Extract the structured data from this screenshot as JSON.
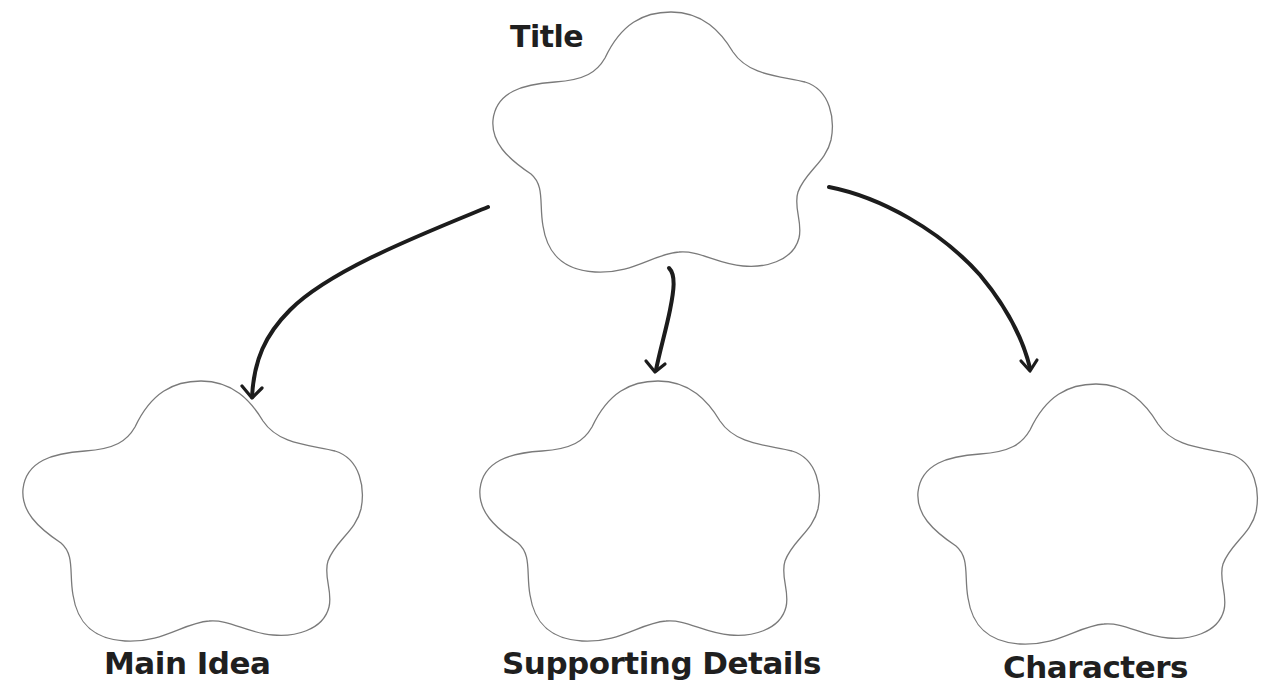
{
  "diagram": {
    "type": "graphic-organizer",
    "colors": {
      "background": "#ffffff",
      "cloud_outline": "#7a7a7a",
      "arrow": "#1c1c1c",
      "label_text": "#1f1f1f"
    },
    "nodes": [
      {
        "id": "title",
        "label": "Title",
        "shape": "cloud",
        "content": ""
      },
      {
        "id": "main-idea",
        "label": "Main Idea",
        "shape": "cloud",
        "content": ""
      },
      {
        "id": "supporting-details",
        "label": "Supporting Details",
        "shape": "cloud",
        "content": ""
      },
      {
        "id": "characters",
        "label": "Characters",
        "shape": "cloud",
        "content": ""
      }
    ],
    "edges": [
      {
        "from": "title",
        "to": "main-idea",
        "style": "hand-drawn-arrow"
      },
      {
        "from": "title",
        "to": "supporting-details",
        "style": "hand-drawn-arrow"
      },
      {
        "from": "title",
        "to": "characters",
        "style": "hand-drawn-arrow"
      }
    ]
  }
}
